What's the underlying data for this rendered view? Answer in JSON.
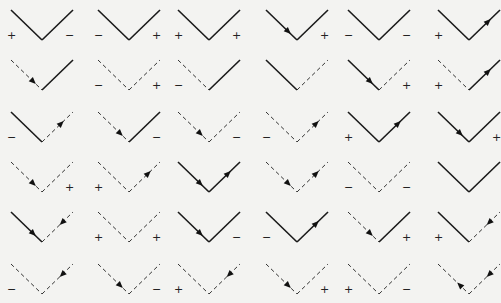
{
  "colors": {
    "line": "#1a1a1a",
    "background": "#f3f3f1"
  },
  "legend": {
    "solid": "solid line",
    "dashed": "dashed line",
    "plus": "+",
    "minus": "−"
  },
  "rows": [
    [
      {
        "left": "solid",
        "right": "solid",
        "left_arrow": "none",
        "right_arrow": "none",
        "left_sign": "+",
        "right_sign": "−"
      },
      {
        "left": "solid",
        "right": "solid",
        "left_arrow": "none",
        "right_arrow": "none",
        "left_sign": "−",
        "right_sign": "+"
      },
      {
        "left": "solid",
        "right": "solid",
        "left_arrow": "none",
        "right_arrow": "none",
        "left_sign": "+",
        "right_sign": "+"
      },
      {
        "left": "solid",
        "right": "solid",
        "left_arrow": "in",
        "right_arrow": "none",
        "left_sign": "",
        "right_sign": "+"
      },
      {
        "left": "solid",
        "right": "solid",
        "left_arrow": "none",
        "right_arrow": "none",
        "left_sign": "−",
        "right_sign": "−"
      },
      {
        "left": "solid",
        "right": "solid",
        "left_arrow": "none",
        "right_arrow": "out",
        "left_sign": "+",
        "right_sign": ""
      }
    ],
    [
      {
        "left": "dashed",
        "right": "solid",
        "left_arrow": "in",
        "right_arrow": "none",
        "left_sign": "",
        "right_sign": ""
      },
      {
        "left": "dashed",
        "right": "dashed",
        "left_arrow": "none",
        "right_arrow": "none",
        "left_sign": "−",
        "right_sign": "+"
      },
      {
        "left": "dashed",
        "right": "solid",
        "left_arrow": "none",
        "right_arrow": "none",
        "left_sign": "−",
        "right_sign": ""
      },
      {
        "left": "solid",
        "right": "dashed",
        "left_arrow": "none",
        "right_arrow": "none",
        "left_sign": "",
        "right_sign": ""
      },
      {
        "left": "solid",
        "right": "dashed",
        "left_arrow": "in",
        "right_arrow": "none",
        "left_sign": "",
        "right_sign": "+"
      },
      {
        "left": "dashed",
        "right": "solid",
        "left_arrow": "none",
        "right_arrow": "out",
        "left_sign": "+",
        "right_sign": ""
      }
    ],
    [
      {
        "left": "solid",
        "right": "dashed",
        "left_arrow": "none",
        "right_arrow": "out",
        "left_sign": "−",
        "right_sign": ""
      },
      {
        "left": "dashed",
        "right": "solid",
        "left_arrow": "in",
        "right_arrow": "none",
        "left_sign": "",
        "right_sign": "−"
      },
      {
        "left": "dashed",
        "right": "dashed",
        "left_arrow": "in",
        "right_arrow": "none",
        "left_sign": "",
        "right_sign": "−"
      },
      {
        "left": "dashed",
        "right": "dashed",
        "left_arrow": "none",
        "right_arrow": "out",
        "left_sign": "−",
        "right_sign": ""
      },
      {
        "left": "solid",
        "right": "solid",
        "left_arrow": "none",
        "right_arrow": "out",
        "left_sign": "+",
        "right_sign": ""
      },
      {
        "left": "solid",
        "right": "solid",
        "left_arrow": "in",
        "right_arrow": "none",
        "left_sign": "",
        "right_sign": "+"
      }
    ],
    [
      {
        "left": "dashed",
        "right": "dashed",
        "left_arrow": "in",
        "right_arrow": "none",
        "left_sign": "",
        "right_sign": "+"
      },
      {
        "left": "dashed",
        "right": "dashed",
        "left_arrow": "none",
        "right_arrow": "out",
        "left_sign": "+",
        "right_sign": ""
      },
      {
        "left": "solid",
        "right": "solid",
        "left_arrow": "in",
        "right_arrow": "out",
        "left_sign": "",
        "right_sign": ""
      },
      {
        "left": "dashed",
        "right": "dashed",
        "left_arrow": "in",
        "right_arrow": "out",
        "left_sign": "",
        "right_sign": ""
      },
      {
        "left": "dashed",
        "right": "dashed",
        "left_arrow": "none",
        "right_arrow": "none",
        "left_sign": "−",
        "right_sign": "−"
      },
      {
        "left": "solid",
        "right": "solid",
        "left_arrow": "none",
        "right_arrow": "none",
        "left_sign": "",
        "right_sign": ""
      }
    ],
    [
      {
        "left": "solid",
        "right": "dashed",
        "left_arrow": "in",
        "right_arrow": "in",
        "left_sign": "",
        "right_sign": ""
      },
      {
        "left": "dashed",
        "right": "dashed",
        "left_arrow": "none",
        "right_arrow": "none",
        "left_sign": "+",
        "right_sign": "+"
      },
      {
        "left": "solid",
        "right": "solid",
        "left_arrow": "in",
        "right_arrow": "none",
        "left_sign": "",
        "right_sign": "−"
      },
      {
        "left": "solid",
        "right": "solid",
        "left_arrow": "none",
        "right_arrow": "out",
        "left_sign": "−",
        "right_sign": ""
      },
      {
        "left": "dashed",
        "right": "solid",
        "left_arrow": "in",
        "right_arrow": "none",
        "left_sign": "",
        "right_sign": "+"
      },
      {
        "left": "solid",
        "right": "dashed",
        "left_arrow": "none",
        "right_arrow": "in",
        "left_sign": "+",
        "right_sign": ""
      }
    ],
    [
      {
        "left": "dashed",
        "right": "dashed",
        "left_arrow": "none",
        "right_arrow": "in",
        "left_sign": "−",
        "right_sign": ""
      },
      {
        "left": "dashed",
        "right": "dashed",
        "left_arrow": "in",
        "right_arrow": "none",
        "left_sign": "",
        "right_sign": "−"
      },
      {
        "left": "dashed",
        "right": "dashed",
        "left_arrow": "none",
        "right_arrow": "in",
        "left_sign": "+",
        "right_sign": ""
      },
      {
        "left": "dashed",
        "right": "dashed",
        "left_arrow": "in",
        "right_arrow": "none",
        "left_sign": "",
        "right_sign": "+"
      },
      {
        "left": "dashed",
        "right": "dashed",
        "left_arrow": "none",
        "right_arrow": "none",
        "left_sign": "+",
        "right_sign": "−"
      },
      {
        "left": "dashed",
        "right": "dashed",
        "left_arrow": "out",
        "right_arrow": "in",
        "left_sign": "",
        "right_sign": ""
      }
    ]
  ]
}
